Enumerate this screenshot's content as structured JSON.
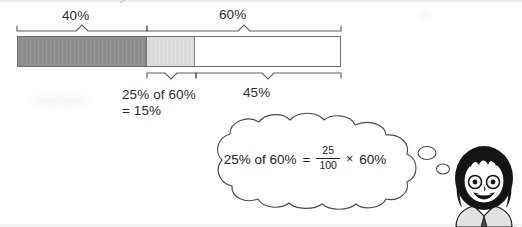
{
  "diagram": {
    "type": "bar-model",
    "bar": {
      "segments": [
        {
          "name": "dark-40",
          "label": "40%",
          "percent": 40,
          "color": "#8c8c8c"
        },
        {
          "name": "light-15",
          "label": "25% of 60% = 15%",
          "percent": 15,
          "color": "#d9d9d9"
        },
        {
          "name": "white-45",
          "label": "45%",
          "percent": 45,
          "color": "#ffffff"
        }
      ],
      "total_percent": 100
    },
    "top_brackets": [
      {
        "name": "bracket-40",
        "label": "40%",
        "spans_percent": 40
      },
      {
        "name": "bracket-60",
        "label": "60%",
        "spans_percent": 60
      }
    ],
    "bottom_brackets": [
      {
        "name": "bracket-25-of-60",
        "label_line1": "25% of 60%",
        "label_line2": "= 15%",
        "spans_percent": 15
      },
      {
        "name": "bracket-45",
        "label": "45%",
        "spans_percent": 45
      }
    ]
  },
  "labels": {
    "forty": "40%",
    "sixty": "60%",
    "twentyfive_of_sixty": "25% of 60%",
    "equals_fifteen": "= 15%",
    "fortyfive": "45%"
  },
  "thought_bubble": {
    "equation": {
      "left": "25% of 60%",
      "equals": "=",
      "numerator": "25",
      "denominator": "100",
      "times": "×",
      "right": "60%"
    }
  },
  "character": {
    "name": "student-girl",
    "description": "cartoon schoolgirl with black bob hair and glasses, smiling",
    "hair_color": "#1a1a1a",
    "skin_color": "#ffffff",
    "uniform_color": "#e8e8e8"
  },
  "colors": {
    "dark_segment": "#8c8c8c",
    "light_segment": "#d9d9d9",
    "white_segment": "#ffffff",
    "outline": "#6e6e6e",
    "text": "#231f20"
  }
}
